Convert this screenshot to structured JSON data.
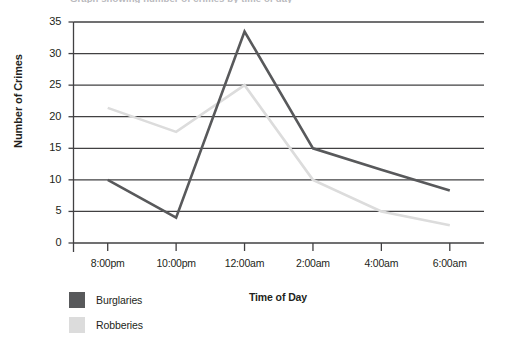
{
  "chart_data": {
    "type": "line",
    "title": "",
    "xlabel": "Time of Day",
    "ylabel": "Number of Crimes",
    "categories": [
      "8:00pm",
      "10:00pm",
      "12:00am",
      "2:00am",
      "4:00am",
      "6:00am"
    ],
    "series": [
      {
        "name": "Burglaries",
        "color": "#58595b",
        "values": [
          10,
          4,
          33.5,
          15,
          11.6,
          8.3
        ]
      },
      {
        "name": "Robberies",
        "color": "#dcdcdc",
        "values": [
          21.4,
          17.6,
          25,
          10,
          5,
          2.8
        ]
      }
    ],
    "ylim": [
      0,
      35
    ],
    "yticks": [
      0,
      5,
      10,
      15,
      20,
      25,
      30,
      35
    ],
    "ytick_labels": [
      "0",
      "5",
      "10",
      "15",
      "20",
      "25",
      "30",
      "35"
    ],
    "grid": true,
    "legend_position": "bottom-left"
  },
  "axes": {
    "y_title": "Number of Crimes",
    "x_title": "Time of Day"
  },
  "legend": {
    "items": [
      {
        "label": "Burglaries",
        "color": "#58595b"
      },
      {
        "label": "Robberies",
        "color": "#dcdcdc"
      }
    ]
  },
  "cropped_header": {
    "text": "Graph showing number of crimes by time of day"
  }
}
